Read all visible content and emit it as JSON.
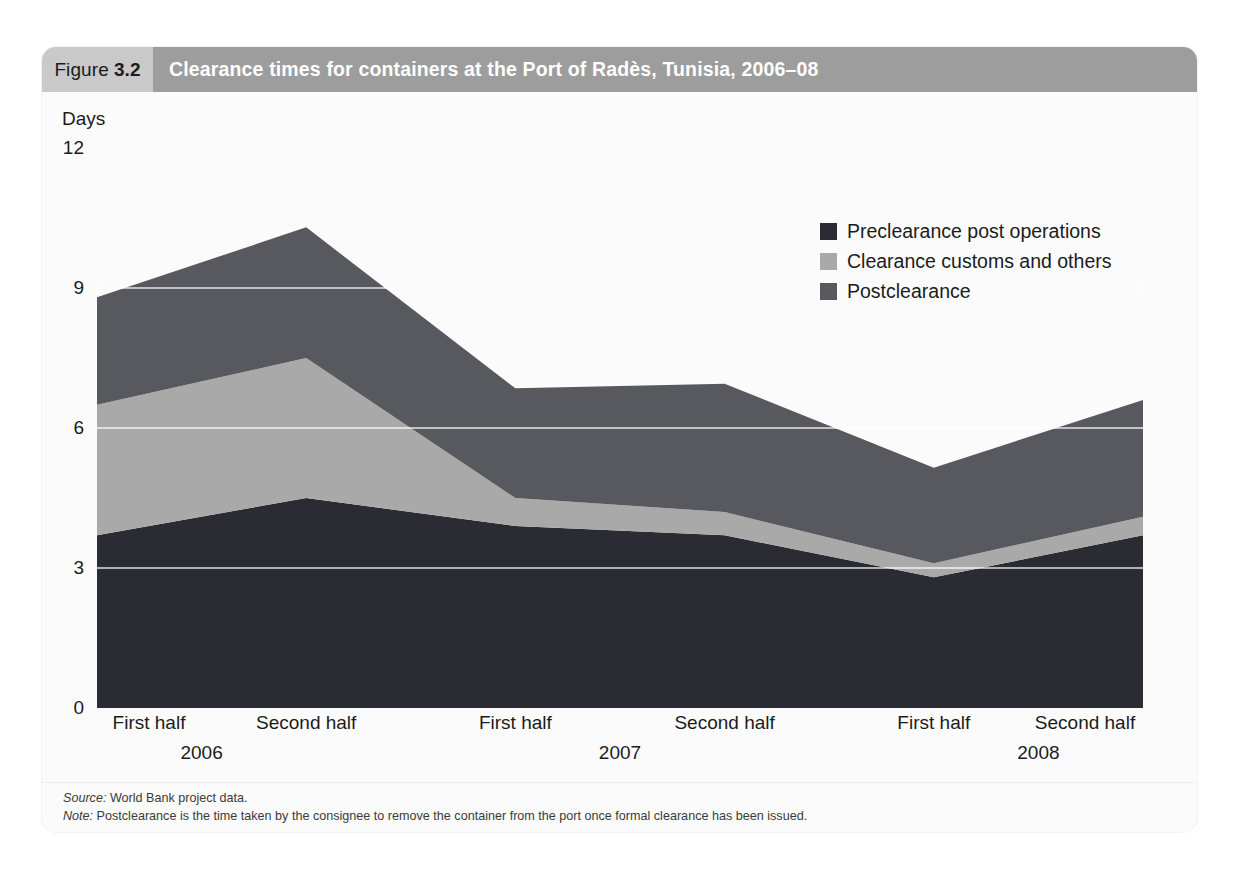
{
  "figure": {
    "tag_label": "Figure",
    "tag_number": "3.2",
    "title": "Clearance times for containers at the Port of Radès, Tunisia, 2006–08"
  },
  "notes": {
    "source_label": "Source:",
    "source_text": "World Bank project data.",
    "note_label": "Note:",
    "note_text": "Postclearance is the time taken by the consignee to remove the container from the port once formal clearance has been issued."
  },
  "colors": {
    "preclearance": "#2b2b33",
    "clearance": "#a9a9a9",
    "postclearance": "#58585f",
    "header_band": "#9d9d9d",
    "header_tag": "#c9c9c9",
    "plot_bg": "#fbfbfb",
    "gridline": "#ffffff"
  },
  "chart_data": {
    "type": "area",
    "title": "Clearance times for containers at the Port of Radès, Tunisia, 2006–08",
    "xlabel": "",
    "ylabel": "Days",
    "ylim": [
      0,
      12
    ],
    "yticks": [
      0,
      3,
      6,
      9,
      12
    ],
    "ytick_labels": [
      "0",
      "3",
      "6",
      "9",
      "12"
    ],
    "grid": true,
    "legend_position": "top-right",
    "stacked": true,
    "categories": [
      "First half 2006",
      "Second half 2006",
      "First half 2007",
      "Second half 2007",
      "First half 2008",
      "Second half 2008"
    ],
    "x_half_labels": [
      "First half",
      "Second half",
      "First half",
      "Second half",
      "First half",
      "Second half"
    ],
    "x_year_labels": [
      "2006",
      "2007",
      "2008"
    ],
    "series": [
      {
        "name": "Preclearance post operations",
        "color": "#2b2b33",
        "values": [
          3.7,
          4.5,
          3.9,
          3.7,
          2.8,
          3.7
        ]
      },
      {
        "name": "Clearance customs and others",
        "color": "#a9a9a9",
        "values": [
          2.8,
          3.0,
          0.6,
          0.5,
          0.3,
          0.4
        ]
      },
      {
        "name": "Postclearance",
        "color": "#58585f",
        "values": [
          2.3,
          2.8,
          2.35,
          2.75,
          2.05,
          2.5
        ]
      }
    ],
    "cumulative_tops": {
      "preclearance": [
        3.7,
        4.5,
        3.9,
        3.7,
        2.8,
        3.7
      ],
      "clearance": [
        6.5,
        7.5,
        4.5,
        4.2,
        3.1,
        4.1
      ],
      "postclearance": [
        8.8,
        10.3,
        6.85,
        6.95,
        5.15,
        6.6
      ]
    }
  },
  "legend": [
    {
      "label": "Preclearance post operations",
      "color": "#2b2b33"
    },
    {
      "label": "Clearance customs and others",
      "color": "#a9a9a9"
    },
    {
      "label": "Postclearance",
      "color": "#58585f"
    }
  ]
}
